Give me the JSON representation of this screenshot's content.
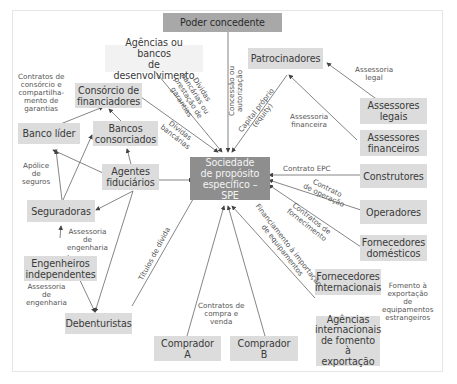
{
  "diagram": {
    "title": "Sociedade de propósito específico – SPE",
    "nodes": {
      "poder": "Poder concedente",
      "agencias_dev_1": "Agências ou bancos",
      "agencias_dev_2": "de desenvolvimento",
      "patrocinadores": "Patrocinadores",
      "consorcio_1": "Consórcio de",
      "consorcio_2": "financiadores",
      "banco_lider": "Banco líder",
      "bancos_cons_1": "Bancos",
      "bancos_cons_2": "consorciados",
      "agentes_1": "Agentes",
      "agentes_2": "fiduciários",
      "spe_1": "Sociedade",
      "spe_2": "de propósito",
      "spe_3": "específico – SPE",
      "seguradoras": "Seguradoras",
      "engenheiros_1": "Engenheiros",
      "engenheiros_2": "independentes",
      "debenturistas": "Debenturistas",
      "comprador_a": "Comprador A",
      "comprador_b": "Comprador B",
      "assessores_legais_1": "Assessores",
      "assessores_legais_2": "legais",
      "assessores_fin_1": "Assessores",
      "assessores_fin_2": "financeiros",
      "construtores": "Construtores",
      "operadores": "Operadores",
      "forn_dom_1": "Fornecedores",
      "forn_dom_2": "domésticos",
      "forn_int_1": "Fornecedores",
      "forn_int_2": "internacionais",
      "agencias_int_1": "Agências",
      "agencias_int_2": "internacionais",
      "agencias_int_3": "de fomento à",
      "agencias_int_4": "exportação"
    },
    "edge_labels": {
      "contratos_consorcio": [
        "Contratos de",
        "consórcio e",
        "compartilha-",
        "mento de",
        "garantias"
      ],
      "dividas_garantias": [
        "Dívidas",
        "bancárias ou",
        "prestação de",
        "garantias"
      ],
      "concessao": [
        "Concessão ou",
        "autorização"
      ],
      "capital_proprio": [
        "Capital próprio",
        "(equity)"
      ],
      "assessoria_legal": [
        "Assessoria",
        "legal"
      ],
      "assessoria_financeira": [
        "Assessoria",
        "financeira"
      ],
      "dividas_bancarias": [
        "Dívidas",
        "bancárias"
      ],
      "apolice": [
        "Apólice",
        "de",
        "seguros"
      ],
      "contrato_epc": "Contrato EPC",
      "contrato_operacao": [
        "Contrato",
        "de operação"
      ],
      "contratos_fornecimento": [
        "Contratos de",
        "fornecimento"
      ],
      "assessoria_eng_1": [
        "Assessoria",
        "de",
        "engenharia"
      ],
      "assessoria_eng_2": [
        "Assessoria",
        "de",
        "engenharia"
      ],
      "titulos_divida": "Títulos de dívida",
      "financiamento_importacao": [
        "Financiamento à importação",
        "de equipamentos"
      ],
      "contratos_compra": [
        "Contratos de",
        "compra e",
        "venda"
      ],
      "fomento_exportacao": [
        "Fomento à",
        "exportação",
        "de",
        "equipamentos",
        "estrangeiros"
      ]
    },
    "colors": {
      "node_bg": "#dcdcdc",
      "spe_bg": "#8e8e8e",
      "poder_bg": "#a8a8a8",
      "line": "#555555"
    }
  }
}
